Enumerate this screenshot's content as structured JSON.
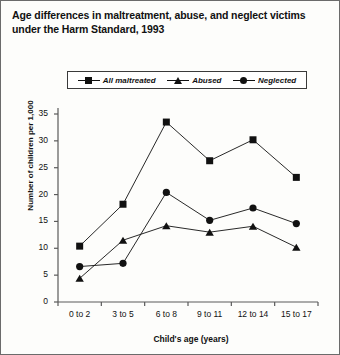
{
  "chart_data": {
    "type": "line",
    "title": "Age differences in maltreatment, abuse, and neglect victims under the Harm Standard, 1993",
    "xlabel": "Child's age (years)",
    "ylabel": "Number of children per 1,000",
    "categories": [
      "0 to 2",
      "3 to 5",
      "6 to 8",
      "9 to 11",
      "12 to 14",
      "15 to 17"
    ],
    "series": [
      {
        "name": "All maltreated",
        "marker": "square",
        "values": [
          10.4,
          18.2,
          33.5,
          26.3,
          30.2,
          23.2
        ]
      },
      {
        "name": "Abused",
        "marker": "triangle",
        "values": [
          4.4,
          11.5,
          14.2,
          13.0,
          14.1,
          10.2
        ]
      },
      {
        "name": "Neglected",
        "marker": "circle",
        "values": [
          6.6,
          7.2,
          20.4,
          15.2,
          17.5,
          14.6
        ]
      }
    ],
    "ylim": [
      0,
      35
    ],
    "yticks": [
      0,
      5,
      10,
      15,
      20,
      25,
      30,
      35
    ],
    "ytick_labels": [
      "0",
      "5",
      "10",
      "15",
      "20",
      "25",
      "30",
      "35"
    ],
    "grid": false,
    "legend_position": "top-center",
    "line_color": "#111111"
  }
}
